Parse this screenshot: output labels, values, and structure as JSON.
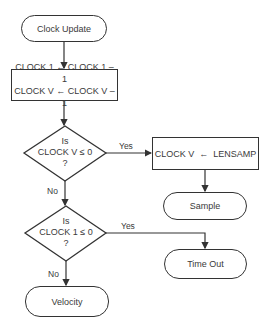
{
  "flowchart": {
    "start": {
      "label": "Clock Update"
    },
    "decrement": {
      "lines": [
        "CLOCK 1 ← CLOCK 1 – 1",
        "CLOCK V ← CLOCK V – 1"
      ]
    },
    "decision_v": {
      "lines": [
        "Is",
        "CLOCK V ≤ 0",
        "?"
      ],
      "yes_label": "Yes",
      "no_label": "No"
    },
    "reset_v": {
      "label": "CLOCK V  ←  LENSAMP"
    },
    "sample": {
      "label": "Sample"
    },
    "decision_1": {
      "lines": [
        "Is",
        "CLOCK 1 ≤ 0",
        "?"
      ],
      "yes_label": "Yes",
      "no_label": "No"
    },
    "timeout": {
      "label": "Time Out"
    },
    "velocity": {
      "label": "Velocity"
    }
  },
  "colors": {
    "line": "#333333",
    "text": "#3a3a3a",
    "background": "#ffffff"
  }
}
